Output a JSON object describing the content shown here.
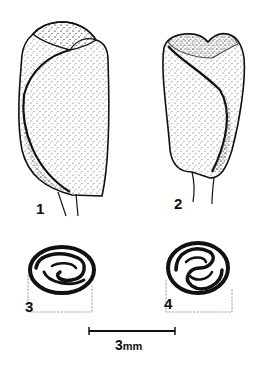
{
  "figures": [
    {
      "id": "1",
      "label": "1",
      "description": "bud side view, left"
    },
    {
      "id": "2",
      "label": "2",
      "description": "bud side view, right"
    },
    {
      "id": "3",
      "label": "3",
      "description": "cross-section contorted aestivation"
    },
    {
      "id": "4",
      "label": "4",
      "description": "cross-section contorted aestivation"
    }
  ],
  "scale_bar": {
    "value": "3",
    "unit": "mm"
  },
  "colors": {
    "ink": "#111111",
    "background": "#ffffff",
    "stipple": "#333333"
  }
}
